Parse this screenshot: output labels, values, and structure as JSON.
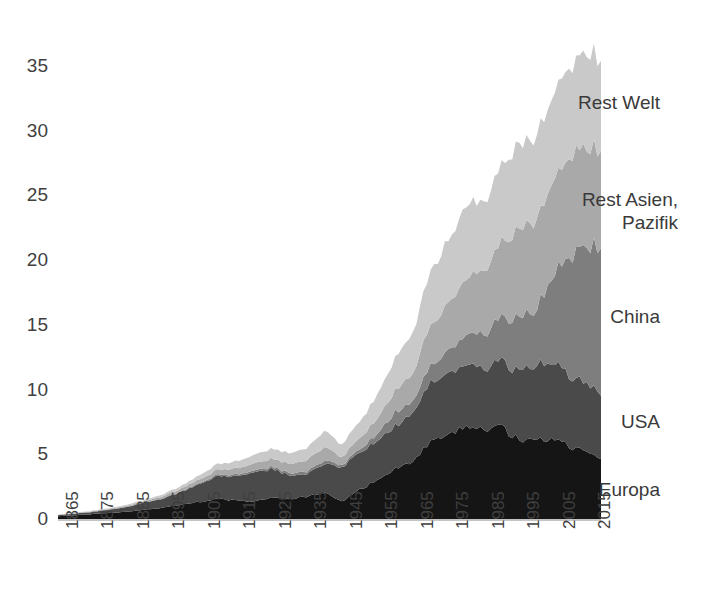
{
  "chart_data": {
    "type": "area",
    "stacked": true,
    "title": "",
    "subtitle": "",
    "xlabel": "",
    "ylabel": "",
    "xlim": [
      1865,
      2018
    ],
    "ylim": [
      0,
      37
    ],
    "grid": false,
    "legend_position": "inline-right",
    "y_ticks": [
      0,
      5,
      10,
      15,
      20,
      25,
      30,
      35
    ],
    "x_ticks": [
      1865,
      1875,
      1885,
      1895,
      1905,
      1915,
      1925,
      1935,
      1945,
      1955,
      1965,
      1975,
      1985,
      1995,
      2005,
      2015
    ],
    "x": [
      1865,
      1870,
      1875,
      1880,
      1885,
      1890,
      1895,
      1900,
      1905,
      1910,
      1915,
      1920,
      1925,
      1930,
      1935,
      1940,
      1945,
      1950,
      1955,
      1960,
      1965,
      1970,
      1975,
      1980,
      1985,
      1990,
      1995,
      2000,
      2005,
      2010,
      2015,
      2018
    ],
    "series": [
      {
        "name": "Europa",
        "color": "#151515",
        "label_color": "#3a3a3a",
        "values": [
          0.22,
          0.3,
          0.38,
          0.48,
          0.6,
          0.75,
          0.88,
          1.1,
          1.32,
          1.55,
          1.42,
          1.35,
          1.62,
          1.55,
          1.7,
          2.05,
          1.35,
          2.25,
          3.05,
          3.85,
          4.55,
          5.85,
          6.35,
          7.2,
          6.95,
          7.05,
          6.05,
          6.1,
          6.15,
          5.55,
          4.95,
          4.8
        ]
      },
      {
        "name": "USA",
        "color": "#4a4a4a",
        "label_color": "#3a3a3a",
        "values": [
          0.08,
          0.12,
          0.18,
          0.26,
          0.38,
          0.55,
          0.72,
          1.0,
          1.4,
          1.75,
          1.85,
          2.25,
          2.2,
          1.85,
          1.75,
          2.2,
          2.6,
          2.85,
          3.1,
          3.25,
          3.75,
          4.55,
          4.65,
          4.85,
          4.7,
          5.05,
          5.35,
          5.75,
          5.85,
          5.4,
          5.15,
          5.1
        ]
      },
      {
        "name": "China",
        "color": "#7e7e7e",
        "label_color": "#3a3a3a",
        "values": [
          0.01,
          0.01,
          0.02,
          0.02,
          0.03,
          0.04,
          0.05,
          0.06,
          0.08,
          0.1,
          0.12,
          0.14,
          0.16,
          0.18,
          0.2,
          0.25,
          0.18,
          0.25,
          0.55,
          1.05,
          0.9,
          1.3,
          1.75,
          2.25,
          2.75,
          3.25,
          4.05,
          4.35,
          7.05,
          9.55,
          10.85,
          11.3
        ]
      },
      {
        "name": "Rest Asien, Pazifik",
        "color": "#a9a9a9",
        "label_color": "#3a3a3a",
        "values": [
          0.02,
          0.03,
          0.04,
          0.05,
          0.07,
          0.1,
          0.14,
          0.2,
          0.28,
          0.38,
          0.45,
          0.55,
          0.62,
          0.7,
          0.85,
          1.05,
          0.6,
          0.85,
          1.2,
          1.65,
          2.15,
          3.15,
          3.65,
          4.4,
          4.95,
          5.85,
          6.85,
          7.05,
          7.45,
          7.85,
          7.35,
          7.4
        ]
      },
      {
        "name": "Rest Welt",
        "color": "#c9c9c9",
        "label_color": "#3a3a3a",
        "values": [
          0.02,
          0.03,
          0.04,
          0.06,
          0.08,
          0.11,
          0.15,
          0.22,
          0.32,
          0.44,
          0.52,
          0.65,
          0.75,
          0.82,
          0.95,
          1.25,
          0.95,
          1.3,
          1.85,
          2.5,
          3.15,
          4.25,
          4.85,
          5.6,
          5.35,
          6.05,
          6.45,
          6.55,
          6.8,
          7.05,
          7.15,
          7.2
        ]
      }
    ],
    "annotations": [
      {
        "name": "Rest Welt",
        "x": 660,
        "y": 103,
        "align": "left"
      },
      {
        "name": "Rest Asien, Pazifik",
        "x": 678,
        "y": 200,
        "align": "right",
        "lines": [
          "Rest Asien,",
          "Pazifik"
        ]
      },
      {
        "name": "China",
        "x": 660,
        "y": 317,
        "align": "left"
      },
      {
        "name": "USA",
        "x": 660,
        "y": 422,
        "align": "left"
      },
      {
        "name": "Europa",
        "x": 660,
        "y": 490,
        "align": "left"
      }
    ]
  }
}
